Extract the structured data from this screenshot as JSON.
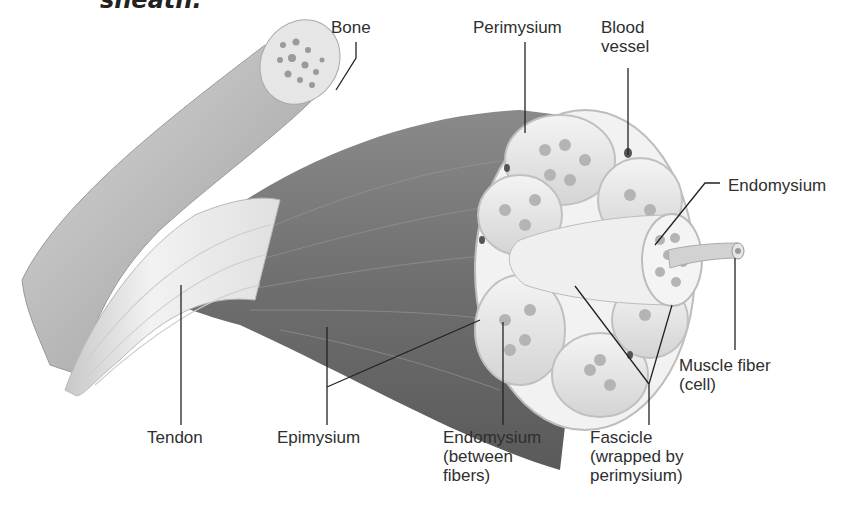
{
  "caption_fragment": "sheath.",
  "figure": {
    "labels": {
      "bone": {
        "lines": [
          "Bone"
        ]
      },
      "perimysium": {
        "lines": [
          "Perimysium"
        ]
      },
      "blood_vessel": {
        "lines": [
          "Blood",
          "vessel"
        ]
      },
      "endomysium_right": {
        "lines": [
          "Endomysium"
        ]
      },
      "muscle_fiber": {
        "lines": [
          "Muscle fiber",
          "(cell)"
        ]
      },
      "tendon": {
        "lines": [
          "Tendon"
        ]
      },
      "epimysium": {
        "lines": [
          "Epimysium"
        ]
      },
      "endomysium_bottom": {
        "lines": [
          "Endomysium",
          "(between",
          "fibers)"
        ]
      },
      "fascicle": {
        "lines": [
          "Fascicle",
          "(wrapped by",
          "perimysium)"
        ]
      }
    }
  }
}
